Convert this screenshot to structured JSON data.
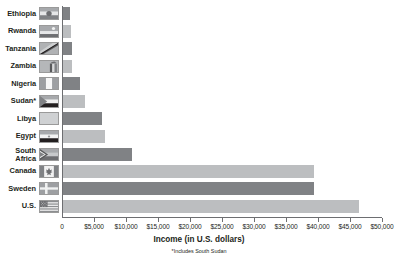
{
  "chart_data": {
    "type": "bar",
    "orientation": "horizontal",
    "title": "",
    "xlabel": "Income (in U.S. dollars)",
    "ylabel": "",
    "xlim": [
      0,
      50000
    ],
    "xtick_step": 5000,
    "grid": false,
    "legend": false,
    "footnote": "*Includes South Sudan",
    "categories": [
      "Ethiopia",
      "Rwanda",
      "Tanzania",
      "Zambia",
      "Nigeria",
      "Sudan*",
      "Libya",
      "Egypt",
      "South\nAfrica",
      "Canada",
      "Sweden",
      "U.S."
    ],
    "values": [
      1300,
      1400,
      1500,
      1600,
      2800,
      3600,
      6200,
      6700,
      10900,
      39400,
      39400,
      46400
    ],
    "tick_labels": [
      "0",
      "$5,000",
      "$10,000",
      "$15,000",
      "$20,000",
      "$25,000",
      "$30,000",
      "$35,000",
      "$40,000",
      "$45,000",
      "$50,000"
    ],
    "bar_colors": [
      "#808285",
      "#bcbec0",
      "#808285",
      "#bcbec0",
      "#808285",
      "#bcbec0",
      "#808285",
      "#bcbec0",
      "#808285",
      "#bcbec0",
      "#808285",
      "#bcbec0"
    ],
    "flags": [
      "flag-ethiopia",
      "flag-rwanda",
      "flag-tanzania",
      "flag-zambia",
      "flag-nigeria",
      "flag-sudan",
      "flag-libya",
      "flag-egypt",
      "flag-south-africa",
      "flag-canada",
      "flag-sweden",
      "flag-united-states"
    ],
    "colors": {
      "bar_dark": "#808285",
      "bar_light": "#bcbec0",
      "axis": "#6d6e71",
      "text": "#231f20",
      "background": "#ffffff"
    }
  }
}
